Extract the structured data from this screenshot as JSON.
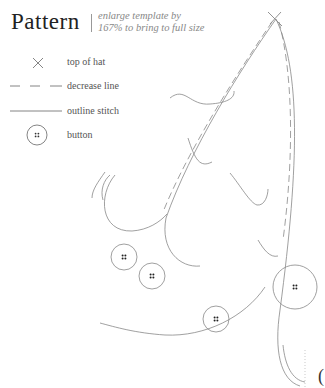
{
  "header": {
    "title": "Pattern",
    "subtitle_line1": "enlarge template by",
    "subtitle_line2": "167% to bring to full size"
  },
  "legend": {
    "items": [
      {
        "icon": "x-mark-icon",
        "label": "top of hat"
      },
      {
        "icon": "dashed-line-icon",
        "label": "decrease line"
      },
      {
        "icon": "solid-line-icon",
        "label": "outline stitch"
      },
      {
        "icon": "button-icon",
        "label": "button"
      }
    ]
  },
  "pattern": {
    "shape": "hat template",
    "buttons_count": 4,
    "stroke_color": "#8a8a8a"
  },
  "edge_glyph": "("
}
